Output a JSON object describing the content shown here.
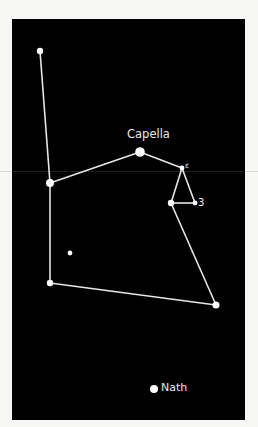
{
  "diagram": {
    "type": "constellation-chart",
    "background_color": "#000000",
    "line_color": "#e6e6e6",
    "star_color": "#ffffff",
    "labels": {
      "capella": "Capella",
      "epsilon": "ε",
      "zeta": "3",
      "nath": "Nath"
    },
    "stars": [
      {
        "id": "top-left",
        "x": 40,
        "y": 51,
        "r": 3.2
      },
      {
        "id": "left-mid",
        "x": 50,
        "y": 183,
        "r": 4
      },
      {
        "id": "capella",
        "x": 140,
        "y": 152,
        "r": 4.8,
        "label": "Capella"
      },
      {
        "id": "epsilon",
        "x": 182,
        "y": 168,
        "r": 2.4,
        "label": "ε"
      },
      {
        "id": "triangle-left",
        "x": 171,
        "y": 203,
        "r": 3.2
      },
      {
        "id": "zeta",
        "x": 195,
        "y": 203,
        "r": 2.4,
        "label": "3"
      },
      {
        "id": "lone",
        "x": 70,
        "y": 253,
        "r": 2.4
      },
      {
        "id": "bottom-left",
        "x": 50,
        "y": 283,
        "r": 3.2
      },
      {
        "id": "bottom-right",
        "x": 216,
        "y": 305,
        "r": 3.5
      },
      {
        "id": "nath",
        "x": 154,
        "y": 389,
        "r": 4,
        "label": "Nath"
      }
    ],
    "lines": [
      [
        "top-left",
        "left-mid"
      ],
      [
        "left-mid",
        "bottom-left"
      ],
      [
        "left-mid",
        "capella"
      ],
      [
        "capella",
        "epsilon"
      ],
      [
        "epsilon",
        "triangle-left"
      ],
      [
        "epsilon",
        "zeta"
      ],
      [
        "triangle-left",
        "zeta"
      ],
      [
        "triangle-left",
        "bottom-right"
      ],
      [
        "bottom-left",
        "bottom-right"
      ]
    ]
  }
}
